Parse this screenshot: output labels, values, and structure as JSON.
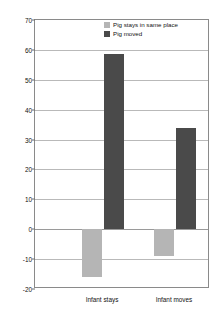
{
  "chart_data": {
    "type": "bar",
    "title": "",
    "xlabel": "",
    "ylabel": "% increase in looking on the test trials",
    "categories": [
      "Infant stays",
      "Infant moves"
    ],
    "series": [
      {
        "name": "Pig stays in same place",
        "color": "#b5b5b5",
        "values": [
          -16,
          -9
        ]
      },
      {
        "name": "Pig moved",
        "color": "#4a4a4a",
        "values": [
          58.7,
          34
        ]
      }
    ],
    "ylim": [
      -20,
      70
    ],
    "ytick_step": 10,
    "yticks": [
      "70",
      "60",
      "50",
      "40",
      "30",
      "20",
      "10",
      "0",
      "-10",
      "-20"
    ],
    "grid": true,
    "legend_position": "top-right"
  }
}
